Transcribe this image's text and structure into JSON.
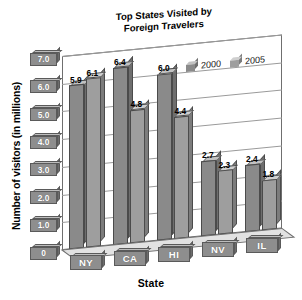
{
  "chart_data": {
    "type": "bar",
    "title": "Top States Visited by Foreign Travelers",
    "title_line1": "Top States Visited by",
    "title_line2": "Foreign Travelers",
    "xlabel": "State",
    "ylabel": "Number of visitors (in millions)",
    "categories": [
      "NY",
      "CA",
      "HI",
      "NV",
      "IL"
    ],
    "series": [
      {
        "name": "2000",
        "values": [
          5.9,
          6.4,
          6.0,
          2.7,
          2.4
        ],
        "color": "#8a8a8a"
      },
      {
        "name": "2005",
        "values": [
          6.1,
          4.8,
          4.4,
          2.3,
          1.8
        ],
        "color": "#a0a0a0"
      }
    ],
    "ylim": [
      0,
      7.0
    ],
    "ytick_labels": [
      "7.0",
      "6.0",
      "5.0",
      "4.0",
      "3.0",
      "2.0",
      "1.0",
      "0"
    ],
    "ytick_values": [
      7.0,
      6.0,
      5.0,
      4.0,
      3.0,
      2.0,
      1.0,
      0
    ],
    "grid": true,
    "legend_position": "top-right",
    "style": "3d-skewed-grayscale"
  },
  "legend": {
    "items": [
      {
        "label": "2000",
        "swatch": "cube-dark"
      },
      {
        "label": "2005",
        "swatch": "cube-light"
      }
    ]
  },
  "colors": {
    "bar_2000_front": "#8a8a8a",
    "bar_2000_top": "#c2c2c2",
    "bar_2000_side": "#6e6e6e",
    "bar_2005_front": "#9e9e9e",
    "bar_2005_top": "#cfcfcf",
    "bar_2005_side": "#7c7c7c",
    "tag_face": "#8e8e8e",
    "tag_top": "#bdbdbd",
    "tag_side": "#6d6d6d",
    "grid": "#9a9a9a",
    "frame": "#6f6f6f",
    "background": "#ffffff",
    "text": "#000000"
  }
}
